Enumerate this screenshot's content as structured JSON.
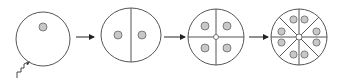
{
  "diagram": {
    "title": "",
    "stages": [
      {
        "label": "fertilized egg",
        "cells": 1,
        "nuclei": 1
      },
      {
        "label": "2-cell stage",
        "cells": 2,
        "nuclei": 2
      },
      {
        "label": "4-cell stage",
        "cells": 4,
        "nuclei": 4
      },
      {
        "label": "8-cell stage",
        "cells": 8,
        "nuclei": 8
      }
    ],
    "arrows": 3,
    "colors": {
      "stroke": "#555555",
      "nucleus_fill": "#c8c8c8",
      "arrow": "#222222",
      "background": "#ffffff"
    }
  }
}
